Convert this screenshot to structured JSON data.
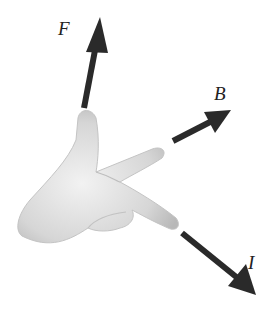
{
  "diagram": {
    "labels": {
      "force": "F",
      "field": "B",
      "current": "I"
    },
    "colors": {
      "arrow": "#2a2a2a",
      "hand": "#d8d8d8",
      "background": "#ffffff"
    }
  }
}
